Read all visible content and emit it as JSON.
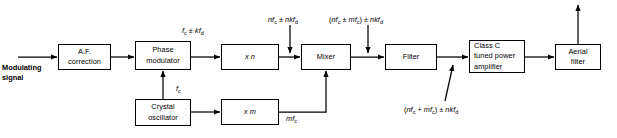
{
  "diagram": {
    "stroke_color": "#000000",
    "background_color": "#ffffff",
    "blocks": [
      {
        "id": "af_correction",
        "label": "A.F.\ncorrection",
        "align": "center",
        "x": 58,
        "y": 44,
        "w": 53,
        "h": 26
      },
      {
        "id": "phase_modulator",
        "label": "Phase\nmodulator",
        "align": "center",
        "x": 135,
        "y": 41,
        "w": 56,
        "h": 29
      },
      {
        "id": "multiplier_n",
        "label": "x n",
        "align": "center",
        "x": 221,
        "y": 44,
        "w": 58,
        "h": 26
      },
      {
        "id": "mixer",
        "label": "Mixer",
        "align": "center",
        "x": 301,
        "y": 44,
        "w": 50,
        "h": 26
      },
      {
        "id": "filter",
        "label": "Filter",
        "align": "center",
        "x": 385,
        "y": 44,
        "w": 52,
        "h": 26
      },
      {
        "id": "class_c_amp",
        "label": "Class C\ntuned power\namplifier",
        "align": "left",
        "x": 469,
        "y": 40,
        "w": 56,
        "h": 33
      },
      {
        "id": "aerial_filter",
        "label": "Aerial\nfilter",
        "align": "center",
        "x": 555,
        "y": 44,
        "w": 46,
        "h": 26
      },
      {
        "id": "crystal_osc",
        "label": "Crystal\noscillator",
        "align": "center",
        "x": 135,
        "y": 99,
        "w": 56,
        "h": 27
      },
      {
        "id": "multiplier_m",
        "label": "x m",
        "align": "center",
        "x": 221,
        "y": 99,
        "w": 58,
        "h": 26
      }
    ],
    "labels": [
      {
        "id": "input_label",
        "text": "Modulating\nsignal",
        "x": 2,
        "y": 63,
        "bold": true
      },
      {
        "id": "pm_output_label",
        "html": "<i>f</i><sub>c</sub> ± <i>kf</i><sub>d</sub>",
        "x": 182,
        "y": 26
      },
      {
        "id": "crystal_freq_label",
        "html": "<i>f</i><sub>c</sub>",
        "x": 176,
        "y": 84
      },
      {
        "id": "n_output_label",
        "html": "<i>nf</i><sub>c</sub> ± <i>nkf</i><sub>d</sub>",
        "x": 268,
        "y": 15
      },
      {
        "id": "mixer_output_label",
        "html": "(<i>nf</i><sub>c</sub> ± <i>mf</i><sub>c</sub>) ± <i>nkf</i><sub>d</sub>",
        "x": 329,
        "y": 15
      },
      {
        "id": "m_output_label",
        "html": "<i>mf</i><sub>c</sub>",
        "x": 286,
        "y": 114
      },
      {
        "id": "filter_output_label",
        "html": "(<i>nf</i><sub>c</sub> + <i>mf</i><sub>c</sub>) ± <i>nkf</i><sub>d</sub>",
        "x": 404,
        "y": 105
      }
    ],
    "connections": [
      {
        "id": "input-to-af",
        "from": "modulating-signal-source",
        "to": "af_correction"
      },
      {
        "id": "af-to-pm",
        "from": "af_correction",
        "to": "phase_modulator"
      },
      {
        "id": "pm-to-n",
        "from": "phase_modulator",
        "to": "multiplier_n"
      },
      {
        "id": "n-to-mixer",
        "from": "multiplier_n",
        "to": "mixer"
      },
      {
        "id": "mixer-to-filter",
        "from": "mixer",
        "to": "filter"
      },
      {
        "id": "filter-to-ampl",
        "from": "filter",
        "to": "class_c_amp"
      },
      {
        "id": "ampl-to-aerial",
        "from": "class_c_amp",
        "to": "aerial_filter"
      },
      {
        "id": "aerial-to-antenna",
        "from": "aerial_filter",
        "to": "antenna-output"
      },
      {
        "id": "crystal-to-pm",
        "from": "crystal_osc",
        "to": "phase_modulator"
      },
      {
        "id": "crystal-to-m",
        "from": "crystal_osc",
        "to": "multiplier_m"
      },
      {
        "id": "m-to-mixer",
        "from": "multiplier_m",
        "to": "mixer"
      }
    ]
  }
}
